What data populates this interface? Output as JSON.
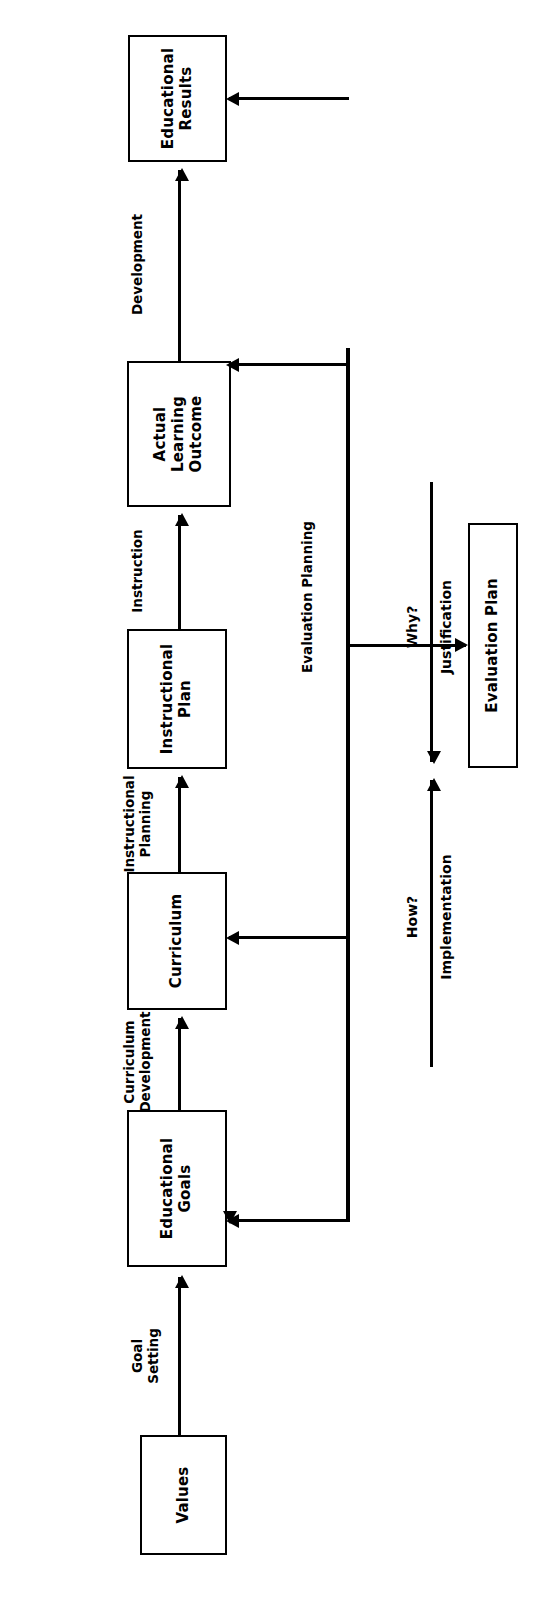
{
  "diagram": {
    "orientation": "rotated-90",
    "nodes": [
      {
        "id": "values",
        "label": "Values"
      },
      {
        "id": "edu_goals",
        "label": "Educational\nGoals"
      },
      {
        "id": "curriculum",
        "label": "Curriculum"
      },
      {
        "id": "instr_plan",
        "label": "Instructional\nPlan"
      },
      {
        "id": "actual_outcome",
        "label": "Actual\nLearning\nOutcome"
      },
      {
        "id": "edu_results",
        "label": "Educational\nResults"
      },
      {
        "id": "eval_plan",
        "label": "Evaluation Plan"
      }
    ],
    "process_edges": [
      {
        "id": "goal_setting",
        "from": "values",
        "to": "edu_goals",
        "label": "Goal\nSetting"
      },
      {
        "id": "curr_dev",
        "from": "edu_goals",
        "to": "curriculum",
        "label": "Curriculum\nDevelopment"
      },
      {
        "id": "instr_planning",
        "from": "curriculum",
        "to": "instr_plan",
        "label": "Instructional\nPlanning"
      },
      {
        "id": "instruction",
        "from": "instr_plan",
        "to": "actual_outcome",
        "label": "Instruction"
      },
      {
        "id": "development",
        "from": "actual_outcome",
        "to": "edu_results",
        "label": "Development"
      }
    ],
    "feedback": {
      "label": "Evaluation Planning",
      "targets": [
        "edu_goals",
        "curriculum",
        "actual_outcome",
        "edu_results"
      ],
      "output_edge_label": ""
    },
    "annotations": [
      {
        "id": "how",
        "question": "How?",
        "label": "Implementation"
      },
      {
        "id": "why",
        "question": "Why?",
        "label": "Justification"
      }
    ],
    "colors": {
      "stroke": "#000000",
      "fill": "#ffffff",
      "text": "#000000"
    }
  }
}
